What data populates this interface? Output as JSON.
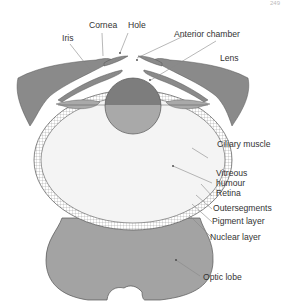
{
  "page_header": {
    "left": "",
    "right": "249"
  },
  "diagram": {
    "colors": {
      "tissue": "#8a8a8a",
      "lens_top": "#7d7d7d",
      "lens_bottom": "#a9a9a9",
      "vitreous": "#f4f4f4",
      "optic_lobe": "#a3a3a3",
      "outline": "#555555",
      "leader": "#888888",
      "text": "#333333"
    },
    "labels": {
      "cornea": "Cornea",
      "hole": "Hole",
      "iris": "Iris",
      "anterior_chamber": "Anterior chamber",
      "lens": "Lens",
      "ciliary_muscle": "Ciliary muscle",
      "vitreous_humour_1": "Vitreous",
      "vitreous_humour_2": "humour",
      "retina": "Retina",
      "outersegments": "Outersegments",
      "pigment_layer": "Pigment layer",
      "nuclear_layer": "Nuclear layer",
      "optic_lobe": "Optic lobe"
    }
  }
}
